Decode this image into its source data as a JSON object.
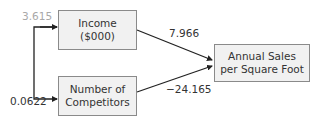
{
  "nodes": {
    "income": {
      "line1": "Income",
      "line2": "($000)"
    },
    "competitors": {
      "line1": "Number of",
      "line2": "Competitors"
    },
    "sales": {
      "line1": "Annual Sales",
      "line2": "per Square Foot"
    }
  },
  "edges": {
    "income_to_sales": "7.966",
    "competitors_to_sales": "−24.165",
    "income_self_label": "3.615",
    "competitors_self_label": "0.0622"
  },
  "colors": {
    "box_fill": "#f1f1f1",
    "box_border": "#8a8a8a",
    "line": "#222222",
    "muted_label": "#a8a8a8"
  }
}
